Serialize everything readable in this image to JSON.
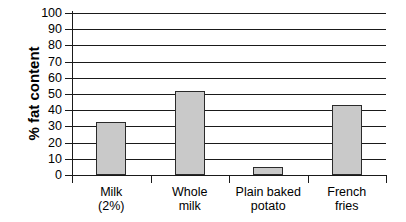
{
  "chart_data": {
    "type": "bar",
    "title": "",
    "xlabel": "",
    "ylabel": "% fat content",
    "categories": [
      "Milk (2%)",
      "Whole milk",
      "Plain baked potato",
      "French fries"
    ],
    "category_lines": [
      [
        "Milk",
        "(2%)"
      ],
      [
        "Whole",
        "milk"
      ],
      [
        "Plain baked",
        "potato"
      ],
      [
        "French",
        "fries"
      ]
    ],
    "values": [
      33,
      52,
      5,
      43
    ],
    "ylim": [
      0,
      100
    ],
    "ytick_step": 10,
    "yticks": [
      100,
      90,
      80,
      70,
      60,
      50,
      40,
      30,
      20,
      10,
      0
    ],
    "ytick_labels": [
      "100",
      "90",
      "80",
      "70",
      "60",
      "50",
      "40",
      "30",
      "20",
      "10",
      "0"
    ],
    "grid": true,
    "grid_axis": "y",
    "legend": false,
    "legend_position": "none",
    "bar_fill_color": "#c9c9c9",
    "bar_border_color": "#2b2b2b",
    "axis_color": "#1a1a1a",
    "background_color": "#ffffff"
  }
}
